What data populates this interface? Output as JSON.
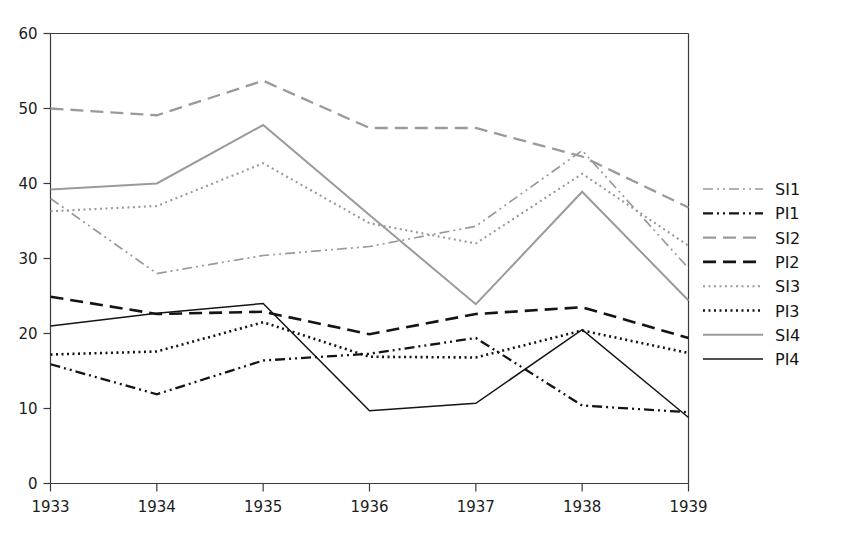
{
  "chart_data": {
    "type": "line",
    "title": "",
    "subtitle": "",
    "xlabel": "",
    "ylabel": "",
    "x": [
      1933,
      1934,
      1935,
      1936,
      1937,
      1938,
      1939
    ],
    "categories": [
      "1933",
      "1934",
      "1935",
      "1936",
      "1937",
      "1938",
      "1939"
    ],
    "xlim": [
      1933,
      1939
    ],
    "ylim": [
      0,
      60
    ],
    "yticks": [
      0,
      10,
      20,
      30,
      40,
      50,
      60
    ],
    "ytick_labels": [
      "0",
      "10",
      "20",
      "30",
      "40",
      "50",
      "60"
    ],
    "xticks": [
      1933,
      1934,
      1935,
      1936,
      1937,
      1938,
      1939
    ],
    "xtick_labels": [
      "1933",
      "1934",
      "1935",
      "1936",
      "1937",
      "1938",
      "1939"
    ],
    "grid": false,
    "legend_position": "right",
    "series": [
      {
        "name": "SI1",
        "values": [
          38.0,
          28.0,
          30.4,
          31.6,
          34.3,
          44.4,
          28.7
        ],
        "color": "#9a9a9a",
        "style": "dash-dot-dot",
        "dasharray": "10,4,2,4,2,4",
        "width": 1.7
      },
      {
        "name": "PI1",
        "values": [
          15.9,
          11.9,
          16.4,
          17.3,
          19.4,
          10.4,
          9.5
        ],
        "color": "#141414",
        "style": "dash-dot-dot",
        "dasharray": "10,4,2,4,2,4",
        "width": 2.3
      },
      {
        "name": "SI2",
        "values": [
          50.0,
          49.1,
          53.7,
          47.4,
          47.4,
          43.6,
          36.8
        ],
        "color": "#9a9a9a",
        "style": "dashed",
        "dasharray": "13,7",
        "width": 2.3
      },
      {
        "name": "PI2",
        "values": [
          24.9,
          22.6,
          22.9,
          19.9,
          22.6,
          23.5,
          19.4
        ],
        "color": "#141414",
        "style": "dashed",
        "dasharray": "13,7",
        "width": 2.6
      },
      {
        "name": "SI3",
        "values": [
          36.3,
          37.0,
          42.7,
          34.7,
          32.0,
          41.3,
          31.7
        ],
        "color": "#9a9a9a",
        "style": "dotted",
        "dasharray": "2,3.5",
        "width": 2.1
      },
      {
        "name": "PI3",
        "values": [
          17.2,
          17.6,
          21.5,
          16.9,
          16.8,
          20.4,
          17.4
        ],
        "color": "#141414",
        "style": "dotted",
        "dasharray": "2,3.5",
        "width": 2.6
      },
      {
        "name": "SI4",
        "values": [
          39.2,
          40.0,
          47.8,
          35.8,
          23.9,
          38.9,
          24.4
        ],
        "color": "#9a9a9a",
        "style": "solid",
        "dasharray": "",
        "width": 2.0
      },
      {
        "name": "PI4",
        "values": [
          21.0,
          22.7,
          24.0,
          9.7,
          10.7,
          20.5,
          8.8
        ],
        "color": "#141414",
        "style": "solid",
        "dasharray": "",
        "width": 1.5
      }
    ],
    "legend_entries": [
      "SI1",
      "PI1",
      "SI2",
      "PI2",
      "SI3",
      "PI3",
      "SI4",
      "PI4"
    ]
  },
  "axes": {
    "y_tick_labels": [
      "60",
      "50",
      "40",
      "30",
      "20",
      "10",
      "0"
    ],
    "x_tick_labels": [
      "1933",
      "1934",
      "1935",
      "1936",
      "1937",
      "1938",
      "1939"
    ]
  },
  "colors": {
    "series_light": "#9a9a9a",
    "series_dark": "#141414",
    "axis": "#3a3a3a",
    "background": "#ffffff"
  }
}
